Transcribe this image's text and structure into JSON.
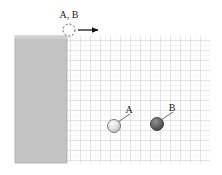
{
  "figure": {
    "background_color": "#ffffff"
  },
  "labels": {
    "launch_point": "A, B",
    "sphere_a": "A",
    "sphere_b": "B"
  },
  "block": {
    "name": "support-block",
    "fill_color": "#c4c4c4",
    "edge_color": "#a8a8a8",
    "x": 15,
    "y": 36,
    "width": 52,
    "height": 127
  },
  "grid": {
    "name": "background-grid",
    "x": 67,
    "y": 36,
    "width": 143,
    "height": 127,
    "minor_spacing": 5,
    "major_spacing": 10,
    "minor_color": "#e2e2e2",
    "major_color": "#c9c9c9"
  },
  "launch_marker": {
    "name": "dashed-launch-circle",
    "cx": 69,
    "cy": 30,
    "r": 6,
    "stroke_color": "#555555",
    "dash": "2 2"
  },
  "velocity_arrow": {
    "name": "velocity-arrow",
    "x1": 78,
    "y1": 30,
    "x2": 99,
    "y2": 30,
    "color": "#111111"
  },
  "spheres": [
    {
      "id": "A",
      "name": "sphere-a",
      "cx": 114,
      "cy": 126,
      "r": 6.5,
      "fill_color": "#e4e4e4",
      "shade_color": "#b5b5b5",
      "edge_color": "#6e6e6e",
      "label_x": 129,
      "label_y": 112,
      "leader_x1": 118,
      "leader_y1": 122,
      "leader_x2": 130,
      "leader_y2": 114
    },
    {
      "id": "B",
      "name": "sphere-b",
      "cx": 157,
      "cy": 124,
      "r": 6.5,
      "fill_color": "#6b6b6b",
      "shade_color": "#4a4a4a",
      "edge_color": "#3a3a3a",
      "label_x": 172,
      "label_y": 110,
      "leader_x1": 161,
      "leader_y1": 120,
      "leader_x2": 173,
      "leader_y2": 112
    }
  ]
}
